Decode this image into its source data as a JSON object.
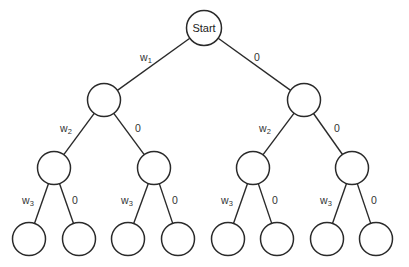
{
  "diagram": {
    "type": "binary-decision-tree",
    "colors": {
      "stroke": "#2a2a2a",
      "background": "#ffffff",
      "text": "#333333"
    },
    "node_radius": 16.5,
    "nodes": [
      {
        "id": "start",
        "label": "Start",
        "x": 204,
        "y": 28,
        "r": 17.5
      },
      {
        "id": "n1L",
        "label": "",
        "x": 104,
        "y": 100
      },
      {
        "id": "n1R",
        "label": "",
        "x": 304,
        "y": 100
      },
      {
        "id": "n2LL",
        "label": "",
        "x": 54,
        "y": 168
      },
      {
        "id": "n2LR",
        "label": "",
        "x": 154,
        "y": 168
      },
      {
        "id": "n2RL",
        "label": "",
        "x": 253,
        "y": 168
      },
      {
        "id": "n2RR",
        "label": "",
        "x": 352,
        "y": 168
      },
      {
        "id": "leaf1",
        "label": "",
        "x": 29,
        "y": 239
      },
      {
        "id": "leaf2",
        "label": "",
        "x": 79,
        "y": 239
      },
      {
        "id": "leaf3",
        "label": "",
        "x": 128,
        "y": 239
      },
      {
        "id": "leaf4",
        "label": "",
        "x": 178,
        "y": 239
      },
      {
        "id": "leaf5",
        "label": "",
        "x": 228,
        "y": 239
      },
      {
        "id": "leaf6",
        "label": "",
        "x": 277,
        "y": 239
      },
      {
        "id": "leaf7",
        "label": "",
        "x": 327,
        "y": 239
      },
      {
        "id": "leaf8",
        "label": "",
        "x": 376,
        "y": 239
      }
    ],
    "edges": [
      {
        "from": "start",
        "to": "n1L",
        "label": "w",
        "sub": "1",
        "lx": 146,
        "ly": 57
      },
      {
        "from": "start",
        "to": "n1R",
        "label": "0",
        "sub": "",
        "lx": 257,
        "ly": 57
      },
      {
        "from": "n1L",
        "to": "n2LL",
        "label": "w",
        "sub": "2",
        "lx": 66,
        "ly": 128
      },
      {
        "from": "n1L",
        "to": "n2LR",
        "label": "0",
        "sub": "",
        "lx": 138,
        "ly": 128
      },
      {
        "from": "n1R",
        "to": "n2RL",
        "label": "w",
        "sub": "2",
        "lx": 265,
        "ly": 128
      },
      {
        "from": "n1R",
        "to": "n2RR",
        "label": "0",
        "sub": "",
        "lx": 337,
        "ly": 128
      },
      {
        "from": "n2LL",
        "to": "leaf1",
        "label": "w",
        "sub": "3",
        "lx": 28,
        "ly": 200
      },
      {
        "from": "n2LL",
        "to": "leaf2",
        "label": "0",
        "sub": "",
        "lx": 75,
        "ly": 200
      },
      {
        "from": "n2LR",
        "to": "leaf3",
        "label": "w",
        "sub": "3",
        "lx": 127,
        "ly": 200
      },
      {
        "from": "n2LR",
        "to": "leaf4",
        "label": "0",
        "sub": "",
        "lx": 175,
        "ly": 200
      },
      {
        "from": "n2RL",
        "to": "leaf5",
        "label": "w",
        "sub": "3",
        "lx": 227,
        "ly": 200
      },
      {
        "from": "n2RL",
        "to": "leaf6",
        "label": "0",
        "sub": "",
        "lx": 275,
        "ly": 200
      },
      {
        "from": "n2RR",
        "to": "leaf7",
        "label": "w",
        "sub": "3",
        "lx": 326,
        "ly": 200
      },
      {
        "from": "n2RR",
        "to": "leaf8",
        "label": "0",
        "sub": "",
        "lx": 374,
        "ly": 200
      }
    ]
  }
}
